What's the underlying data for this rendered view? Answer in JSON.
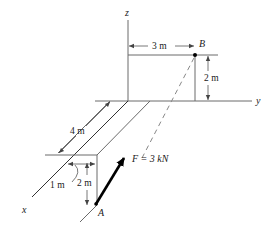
{
  "diagram": {
    "axes": {
      "x_label": "x",
      "y_label": "y",
      "z_label": "z"
    },
    "points": {
      "A_label": "A",
      "B_label": "B"
    },
    "force": {
      "label": "F = 3 kN",
      "magnitude": 3,
      "unit": "kN",
      "direction": "from A toward B"
    },
    "dimensions": {
      "y_offset_B": "3 m",
      "z_height_B": "2 m",
      "x_length": "4 m",
      "y_offset_A": "1 m",
      "z_depth_A": "2 m"
    },
    "colors": {
      "line": "#6a6a6a",
      "force": "#000000",
      "text": "#1a1a1a"
    }
  }
}
